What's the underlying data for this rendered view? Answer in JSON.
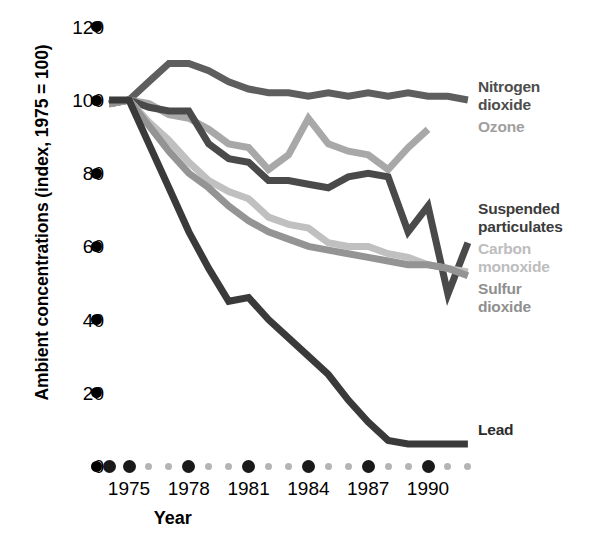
{
  "chart_data": {
    "type": "line",
    "title": "",
    "xlabel": "Year",
    "ylabel": "Ambient concentrations (index, 1975 = 100)",
    "ylim": [
      0,
      128
    ],
    "xlim": [
      1974,
      1992.5
    ],
    "grid": false,
    "legend_position": "right-inline",
    "y_ticks": [
      0,
      20,
      40,
      60,
      80,
      100,
      120
    ],
    "y_tick_labels": [
      "0",
      "20",
      "40",
      "60",
      "80",
      "100",
      "120"
    ],
    "x_ticks": [
      1974,
      1975,
      1976,
      1977,
      1978,
      1979,
      1980,
      1981,
      1982,
      1983,
      1984,
      1985,
      1986,
      1987,
      1988,
      1989,
      1990,
      1991,
      1992
    ],
    "x_tick_labels": [
      "1975",
      "1978",
      "1981",
      "1984",
      "1987",
      "1990"
    ],
    "x_major_ticks": [
      1974,
      1975,
      1978,
      1981,
      1984,
      1987,
      1990
    ],
    "x": [
      1974,
      1975,
      1976,
      1977,
      1978,
      1979,
      1980,
      1981,
      1982,
      1983,
      1984,
      1985,
      1986,
      1987,
      1988,
      1989,
      1990,
      1991,
      1992
    ],
    "series": [
      {
        "name": "Nitrogen dioxide",
        "color": "#5e5e5e",
        "label_color": "#4d4d4d",
        "values": [
          99,
          100,
          105,
          110,
          110,
          108,
          105,
          103,
          102,
          102,
          101,
          102,
          101,
          102,
          101,
          102,
          101,
          101,
          100
        ]
      },
      {
        "name": "Ozone",
        "color": "#a8a8a8",
        "label_color": "#a0a0a0",
        "values": [
          99,
          100,
          99,
          96,
          95,
          92,
          88,
          87,
          81,
          85,
          95,
          88,
          86,
          85,
          81,
          87,
          92,
          null,
          null
        ]
      },
      {
        "name": "Suspended particulates",
        "color": "#4a4a4a",
        "label_color": "#3c3c3c",
        "values": [
          99,
          100,
          98,
          97,
          97,
          88,
          84,
          83,
          78,
          78,
          77,
          76,
          79,
          80,
          79,
          64,
          71,
          47,
          61
        ]
      },
      {
        "name": "Carbon monoxide",
        "color": "#c0c0c0",
        "label_color": "#bdbdbd",
        "values": [
          99,
          100,
          94,
          89,
          83,
          78,
          75,
          73,
          68,
          66,
          65,
          61,
          60,
          60,
          58,
          57,
          55,
          54,
          53
        ]
      },
      {
        "name": "Sulfur dioxide",
        "color": "#949494",
        "label_color": "#8f8f8f",
        "values": [
          99,
          100,
          93,
          86,
          80,
          76,
          71,
          67,
          64,
          62,
          60,
          59,
          58,
          57,
          56,
          55,
          55,
          54,
          52
        ]
      },
      {
        "name": "Lead",
        "color": "#3a3a3a",
        "label_color": "#2b2b2b",
        "values": [
          100,
          100,
          88,
          76,
          64,
          54,
          45,
          46,
          40,
          35,
          30,
          25,
          18,
          12,
          7,
          6,
          6,
          6,
          6
        ]
      }
    ]
  },
  "axes": {
    "y_title": "Ambient concentrations (index, 1975 = 100)",
    "x_title": "Year"
  },
  "series_labels": [
    {
      "text": "Nitrogen\ndioxide",
      "name": "nitrogen-dioxide"
    },
    {
      "text": "Ozone",
      "name": "ozone"
    },
    {
      "text": "Suspended\nparticulates",
      "name": "suspended-particulates"
    },
    {
      "text": "Carbon\nmonoxide",
      "name": "carbon-monoxide"
    },
    {
      "text": "Sulfur\ndioxide",
      "name": "sulfur-dioxide"
    },
    {
      "text": "Lead",
      "name": "lead"
    }
  ]
}
